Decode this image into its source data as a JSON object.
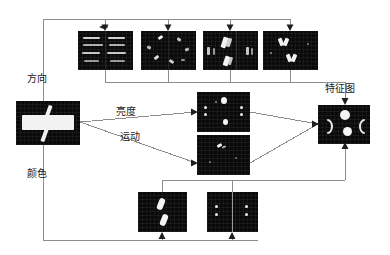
{
  "diagram": {
    "title_labels": {
      "direction": "方向",
      "color": "颜色",
      "luminance": "亮度",
      "motion": "运动",
      "feature_map": "特征图"
    },
    "nodes": {
      "input": {
        "name": "input-image",
        "caption": ""
      },
      "orientation_maps": [
        {
          "name": "orientation-map-0deg"
        },
        {
          "name": "orientation-map-45deg"
        },
        {
          "name": "orientation-map-90deg"
        },
        {
          "name": "orientation-map-135deg"
        }
      ],
      "luminance_map": {
        "name": "luminance-conspicuity-map"
      },
      "motion_map": {
        "name": "motion-conspicuity-map"
      },
      "color_map_left": {
        "name": "color-map-red-green"
      },
      "color_map_right": {
        "name": "color-map-blue-yellow"
      },
      "saliency": {
        "name": "saliency-feature-map"
      }
    },
    "colors": {
      "wire": "#8a8a8a",
      "panel_bg": "#0a0a0a",
      "highlight": "#f2f2f2",
      "text": "#1a1a1a"
    }
  }
}
